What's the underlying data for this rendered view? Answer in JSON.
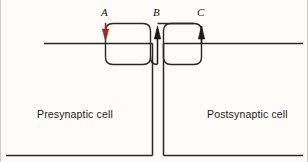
{
  "figure": {
    "background_color": "#fdfcf8",
    "line_color": "#2b2622",
    "arrow_a_color": "#9e2a2a",
    "arrow_bc_color": "#1a1a1a",
    "membrane_accent_color": "#7fd4b8"
  },
  "markers": [
    {
      "id": "A",
      "label": "A",
      "x": 105,
      "y": 14,
      "direction": "down",
      "color": "#9e2a2a"
    },
    {
      "id": "B",
      "label": "B",
      "x": 157,
      "y": 14,
      "direction": "up",
      "color": "#1a1a1a"
    },
    {
      "id": "C",
      "label": "C",
      "x": 201,
      "y": 14,
      "direction": "up",
      "color": "#1a1a1a"
    }
  ],
  "cells": [
    {
      "id": "presynaptic",
      "label": "Presynaptic cell",
      "x": 37,
      "y": 114
    },
    {
      "id": "postsynaptic",
      "label": "Postsynaptic cell",
      "x": 207,
      "y": 114
    }
  ],
  "geometry": {
    "membrane_y": 43,
    "membrane_left_start": 5,
    "membrane_left_end": 303,
    "cleft_left_x": 152,
    "cleft_right_x": 164,
    "bottom_y": 155,
    "loop_top_y": 23,
    "loop_bottom_y": 65
  }
}
